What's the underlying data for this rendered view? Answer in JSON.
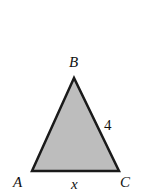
{
  "figure": {
    "type": "triangle",
    "fill_color": "#bdbdbd",
    "stroke_color": "#1a1a1a",
    "vertices": {
      "A": {
        "label": "A"
      },
      "B": {
        "label": "B"
      },
      "C": {
        "label": "C"
      }
    },
    "sides": {
      "BC": {
        "label": "4"
      },
      "AC": {
        "label": "x"
      }
    }
  }
}
